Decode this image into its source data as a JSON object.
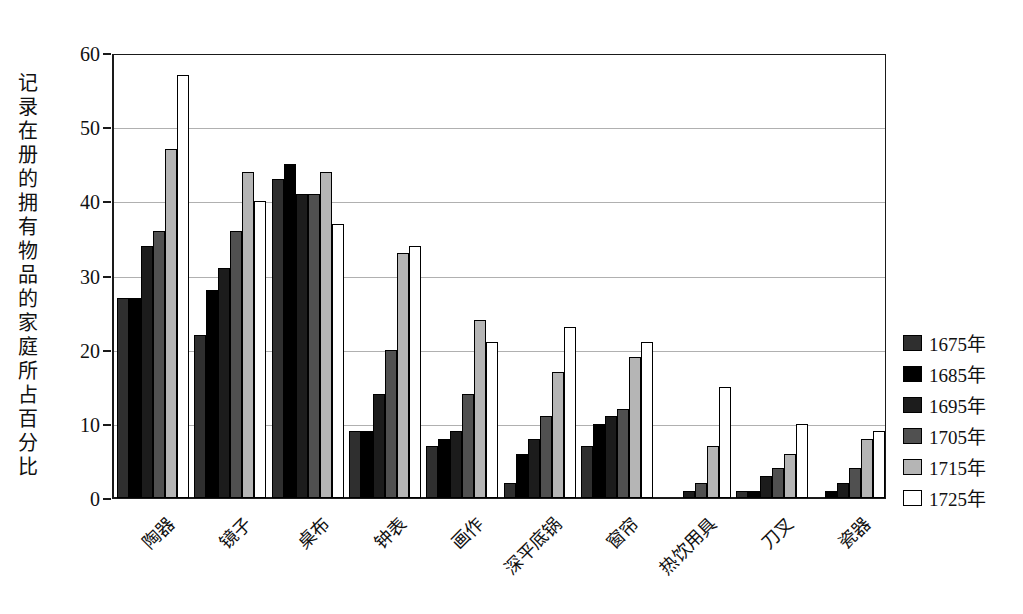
{
  "chart_data": {
    "type": "bar",
    "title": "",
    "xlabel": "",
    "ylabel": "记录在册的拥有物品的家庭所占百分比",
    "ylim": [
      0,
      60
    ],
    "yticks": [
      0,
      10,
      20,
      30,
      40,
      50,
      60
    ],
    "grid": "horizontal",
    "legend_position": "right",
    "categories": [
      "陶器",
      "镜子",
      "桌布",
      "钟表",
      "画作",
      "深平底锅",
      "窗帘",
      "热饮用具",
      "刀叉",
      "瓷器"
    ],
    "series": [
      {
        "name": "1675年",
        "color": "#2f2f2f",
        "values": [
          27,
          22,
          43,
          9,
          7,
          2,
          7,
          0,
          1,
          0
        ]
      },
      {
        "name": "1685年",
        "color": "#000000",
        "values": [
          27,
          28,
          45,
          9,
          8,
          6,
          10,
          0,
          1,
          1
        ]
      },
      {
        "name": "1695年",
        "color": "#1c1c1c",
        "values": [
          34,
          31,
          41,
          14,
          9,
          8,
          11,
          1,
          3,
          2
        ]
      },
      {
        "name": "1705年",
        "color": "#505050",
        "values": [
          36,
          36,
          41,
          20,
          14,
          11,
          12,
          2,
          4,
          4
        ]
      },
      {
        "name": "1715年",
        "color": "#b5b5b5",
        "values": [
          47,
          44,
          44,
          33,
          24,
          17,
          19,
          7,
          6,
          8
        ]
      },
      {
        "name": "1725年",
        "color": "#ffffff",
        "values": [
          57,
          40,
          37,
          34,
          21,
          23,
          21,
          15,
          10,
          9
        ]
      }
    ],
    "colors": {
      "axis": "#1a1a1a",
      "gridline": "#b0b0b0",
      "background": "#ffffff"
    }
  }
}
